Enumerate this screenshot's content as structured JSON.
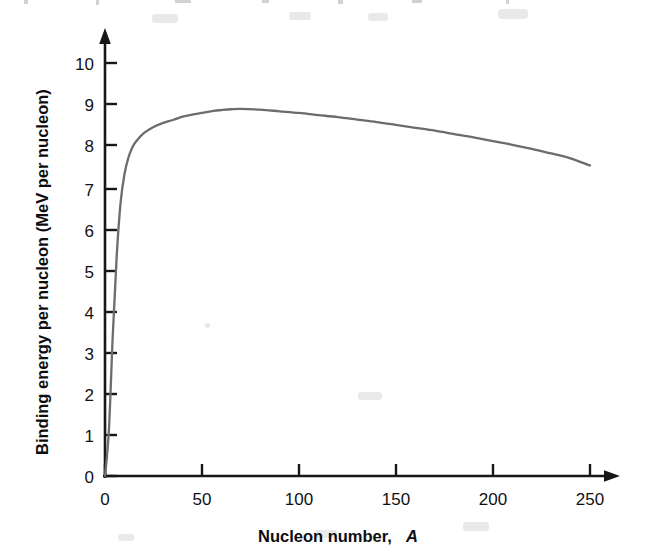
{
  "chart_data": {
    "type": "line",
    "title": "",
    "xlabel": "Nucleon number, A",
    "xlabel_main": "Nucleon number,",
    "xlabel_symbol": "A",
    "ylabel": "Binding energy per nucleon (MeV per nucleon)",
    "xlim": [
      0,
      262
    ],
    "ylim": [
      0,
      10.4
    ],
    "xticks": [
      0,
      50,
      100,
      150,
      200,
      250
    ],
    "xtick_labels": [
      "0",
      "50",
      "100",
      "150",
      "200",
      "250"
    ],
    "yticks": [
      0,
      1,
      2,
      3,
      4,
      5,
      6,
      7,
      8,
      9,
      10
    ],
    "ytick_labels": [
      "0",
      "1",
      "2",
      "3",
      "4",
      "5",
      "6",
      "7",
      "8",
      "9",
      "10"
    ],
    "grid": false,
    "legend": null,
    "series": [
      {
        "name": "Binding energy per nucleon",
        "color": "#6c6c6e",
        "x": [
          0,
          2,
          4,
          6,
          8,
          10,
          12,
          14,
          16,
          20,
          25,
          30,
          35,
          40,
          45,
          50,
          56,
          60,
          65,
          70,
          80,
          90,
          100,
          110,
          120,
          130,
          140,
          150,
          160,
          170,
          180,
          190,
          200,
          210,
          220,
          230,
          238,
          250
        ],
        "y": [
          0.0,
          1.1,
          3.4,
          5.3,
          6.6,
          7.3,
          7.7,
          7.95,
          8.1,
          8.3,
          8.45,
          8.55,
          8.62,
          8.7,
          8.75,
          8.79,
          8.84,
          8.86,
          8.88,
          8.89,
          8.87,
          8.83,
          8.79,
          8.74,
          8.69,
          8.63,
          8.57,
          8.5,
          8.43,
          8.36,
          8.28,
          8.2,
          8.11,
          8.02,
          7.92,
          7.81,
          7.72,
          7.52
        ]
      }
    ],
    "annotations": {
      "peak_label": "peak ~8.9 MeV near A = 60",
      "endpoint_label": "~7.5 MeV at A = 250"
    },
    "axis_style": {
      "x_axis_arrow": true,
      "y_axis_arrow": true,
      "axis_color": "#17171a",
      "curve_color": "#6c6c6e"
    }
  },
  "figure": {
    "background": "#ffffff",
    "caption": ""
  }
}
